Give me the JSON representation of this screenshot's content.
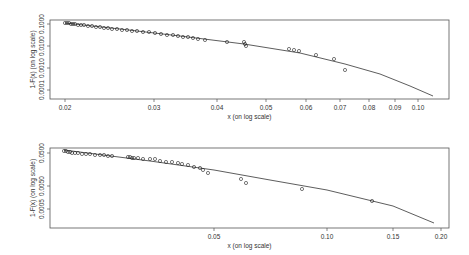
{
  "chart_data": [
    {
      "type": "scatter",
      "title": "",
      "xlabel": "x (on log scale)",
      "ylabel": "1-F(x) (on log scale)",
      "x_scale": "log",
      "y_scale": "log",
      "x_ticks": [
        "0.02",
        "0.03",
        "0.04",
        "0.05",
        "0.06",
        "0.07",
        "0.08",
        "0.09",
        "0.10"
      ],
      "y_ticks": [
        "0.1000",
        "0.0100",
        "0.0010",
        "0.0001"
      ],
      "xlim": [
        0.0195,
        0.113
      ],
      "ylim": [
        5e-05,
        0.13
      ],
      "grid": false,
      "legend": null,
      "series": [
        {
          "name": "empirical points",
          "marker": "open circle",
          "x": [
            0.02,
            0.0202,
            0.0204,
            0.0206,
            0.0208,
            0.021,
            0.0213,
            0.0216,
            0.022,
            0.0225,
            0.023,
            0.0236,
            0.0242,
            0.0248,
            0.0255,
            0.0262,
            0.027,
            0.0278,
            0.0285,
            0.0292,
            0.03,
            0.0308,
            0.0315,
            0.0322,
            0.033,
            0.0338,
            0.0346,
            0.035,
            0.0355,
            0.036,
            0.037,
            0.038,
            0.0395,
            0.042,
            0.0455,
            0.0458,
            0.046,
            0.056,
            0.0575,
            0.059,
            0.063,
            0.068,
            0.072
          ],
          "y": [
            0.1,
            0.098,
            0.096,
            0.094,
            0.092,
            0.09,
            0.087,
            0.084,
            0.081,
            0.078,
            0.075,
            0.072,
            0.069,
            0.066,
            0.063,
            0.06,
            0.057,
            0.054,
            0.051,
            0.048,
            0.046,
            0.044,
            0.042,
            0.04,
            0.038,
            0.036,
            0.034,
            0.032,
            0.031,
            0.03,
            0.028,
            0.026,
            0.024,
            0.021,
            0.017,
            0.016,
            0.014,
            0.008,
            0.0072,
            0.0065,
            0.0045,
            0.003,
            0.0012
          ]
        },
        {
          "name": "fitted curve",
          "type": "line",
          "x": [
            0.02,
            0.03,
            0.04,
            0.05,
            0.06,
            0.07,
            0.08,
            0.09,
            0.1,
            0.106
          ],
          "y": [
            0.105,
            0.052,
            0.028,
            0.016,
            0.0095,
            0.0055,
            0.0028,
            0.0012,
            0.00045,
            8e-05
          ]
        }
      ]
    },
    {
      "type": "scatter",
      "title": "",
      "xlabel": "x (on log scale)",
      "ylabel": "1-F(x) (on log scale)",
      "x_scale": "log",
      "y_scale": "log",
      "x_ticks": [
        "0.05",
        "0.10",
        "0.15",
        "0.20"
      ],
      "y_ticks": [
        "0.0500",
        "0.0050",
        "0.0005"
      ],
      "xlim": [
        0.018,
        0.21
      ],
      "ylim": [
        0.0002,
        0.07
      ],
      "grid": false,
      "legend": null,
      "series": [
        {
          "name": "empirical points",
          "marker": "open circle",
          "x": [
            0.02,
            0.0205,
            0.021,
            0.0215,
            0.022,
            0.0228,
            0.0235,
            0.0245,
            0.0255,
            0.0265,
            0.028,
            0.029,
            0.03,
            0.033,
            0.0335,
            0.034,
            0.0345,
            0.0355,
            0.037,
            0.038,
            0.0395,
            0.041,
            0.042,
            0.0435,
            0.045,
            0.0465,
            0.048,
            0.066,
            0.0685,
            0.09,
            0.13
          ],
          "y": [
            0.05,
            0.048,
            0.046,
            0.044,
            0.042,
            0.04,
            0.038,
            0.036,
            0.034,
            0.032,
            0.03,
            0.028,
            0.026,
            0.024,
            0.023,
            0.022,
            0.021,
            0.02,
            0.019,
            0.018,
            0.017,
            0.016,
            0.015,
            0.014,
            0.013,
            0.012,
            0.011,
            0.0065,
            0.0055,
            0.0035,
            0.0016
          ]
        },
        {
          "name": "fitted line",
          "type": "line",
          "x": [
            0.02,
            0.05,
            0.1,
            0.15,
            0.195
          ],
          "y": [
            0.055,
            0.0125,
            0.004,
            0.0018,
            0.0003
          ]
        }
      ]
    }
  ],
  "panels": [
    {
      "frame": {
        "x": 50,
        "y": 20,
        "w": 399,
        "h": 79
      },
      "xlabel": "x (on log scale)",
      "ylabel": "1-F(x) (on log scale)",
      "x_ticks": [
        {
          "label": "0.02",
          "px": 65
        },
        {
          "label": "0.03",
          "px": 154
        },
        {
          "label": "0.04",
          "px": 217
        },
        {
          "label": "0.05",
          "px": 266
        },
        {
          "label": "0.06",
          "px": 306
        },
        {
          "label": "0.07",
          "px": 340
        },
        {
          "label": "0.08",
          "px": 369
        },
        {
          "label": "0.09",
          "px": 395
        },
        {
          "label": "0.10",
          "px": 418
        }
      ],
      "y_ticks": [
        {
          "label": "0.1000",
          "py": 24
        },
        {
          "label": "0.0100",
          "py": 46
        },
        {
          "label": "0.0010",
          "py": 68
        },
        {
          "label": "0.0001",
          "py": 90
        }
      ],
      "points": [
        [
          65,
          23
        ],
        [
          67,
          23
        ],
        [
          69,
          23
        ],
        [
          71,
          24
        ],
        [
          73,
          24
        ],
        [
          75,
          24
        ],
        [
          78,
          25
        ],
        [
          81,
          25
        ],
        [
          84,
          25
        ],
        [
          88,
          26
        ],
        [
          92,
          26
        ],
        [
          96,
          27
        ],
        [
          100,
          27
        ],
        [
          104,
          28
        ],
        [
          108,
          28
        ],
        [
          112,
          29
        ],
        [
          117,
          29
        ],
        [
          122,
          30
        ],
        [
          127,
          30
        ],
        [
          132,
          31
        ],
        [
          137,
          31
        ],
        [
          143,
          32
        ],
        [
          149,
          32
        ],
        [
          155,
          33
        ],
        [
          161,
          34
        ],
        [
          167,
          35
        ],
        [
          173,
          35
        ],
        [
          178,
          36
        ],
        [
          183,
          37
        ],
        [
          188,
          37
        ],
        [
          193,
          38
        ],
        [
          198,
          39
        ],
        [
          205,
          40
        ],
        [
          227,
          42
        ],
        [
          244,
          42
        ],
        [
          245,
          44
        ],
        [
          246,
          46
        ],
        [
          289,
          49
        ],
        [
          294,
          50
        ],
        [
          299,
          51
        ],
        [
          316,
          55
        ],
        [
          334,
          59
        ],
        [
          345,
          70
        ]
      ],
      "curve": [
        [
          65,
          23
        ],
        [
          120,
          29
        ],
        [
          180,
          36
        ],
        [
          244,
          44
        ],
        [
          300,
          53
        ],
        [
          345,
          64
        ],
        [
          380,
          74
        ],
        [
          410,
          86
        ],
        [
          433,
          96
        ]
      ]
    },
    {
      "frame": {
        "x": 50,
        "y": 148,
        "w": 399,
        "h": 80
      },
      "xlabel": "x (on log scale)",
      "ylabel": "1-F(x) (on log scale)",
      "x_ticks": [
        {
          "label": "0.05",
          "px": 214
        },
        {
          "label": "0.10",
          "px": 327
        },
        {
          "label": "0.15",
          "px": 393
        },
        {
          "label": "0.20",
          "px": 441
        }
      ],
      "y_ticks": [
        {
          "label": "0.0500",
          "py": 153
        },
        {
          "label": "0.0050",
          "py": 186
        },
        {
          "label": "0.0005",
          "py": 209
        }
      ],
      "points": [
        [
          64,
          151
        ],
        [
          66,
          151
        ],
        [
          68,
          152
        ],
        [
          70,
          152
        ],
        [
          72,
          153
        ],
        [
          75,
          153
        ],
        [
          78,
          153
        ],
        [
          82,
          154
        ],
        [
          86,
          154
        ],
        [
          90,
          154
        ],
        [
          95,
          155
        ],
        [
          100,
          155
        ],
        [
          104,
          155
        ],
        [
          108,
          156
        ],
        [
          112,
          156
        ],
        [
          128,
          157
        ],
        [
          130,
          157
        ],
        [
          132,
          158
        ],
        [
          134,
          158
        ],
        [
          138,
          158
        ],
        [
          143,
          159
        ],
        [
          150,
          159
        ],
        [
          155,
          159
        ],
        [
          160,
          161
        ],
        [
          166,
          162
        ],
        [
          172,
          162
        ],
        [
          178,
          163
        ],
        [
          182,
          164
        ],
        [
          188,
          165
        ],
        [
          194,
          167
        ],
        [
          200,
          168
        ],
        [
          203,
          170
        ],
        [
          208,
          173
        ],
        [
          241,
          179
        ],
        [
          246,
          183
        ],
        [
          302,
          189
        ],
        [
          372,
          201
        ]
      ],
      "curve": [
        [
          64,
          150
        ],
        [
          150,
          161
        ],
        [
          214,
          170
        ],
        [
          270,
          180
        ],
        [
          327,
          190
        ],
        [
          393,
          206
        ],
        [
          434,
          223
        ]
      ]
    }
  ]
}
